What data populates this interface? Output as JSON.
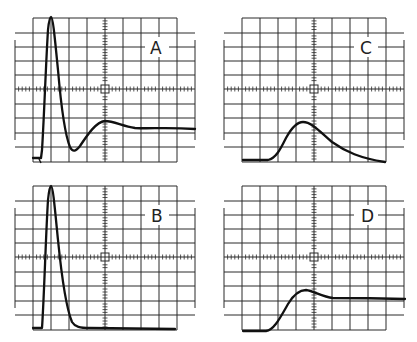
{
  "figure": {
    "panels": [
      {
        "id": "A",
        "label": "A",
        "position": "top-left",
        "trace": "damped-oscillation: sharp spike, undershoot, ringing, settles above baseline"
      },
      {
        "id": "C",
        "label": "C",
        "position": "top-right",
        "trace": "broad smooth pulse, slow rise and long decay"
      },
      {
        "id": "B",
        "label": "B",
        "position": "bottom-left",
        "trace": "narrow sharp pulse returning to baseline"
      },
      {
        "id": "D",
        "label": "D",
        "position": "bottom-right",
        "trace": "step rise with slight overshoot, settles to plateau"
      }
    ],
    "grid": {
      "horizontal_divisions": 10,
      "vertical_divisions": 10,
      "minor_ticks_per_division": 5
    },
    "colors": {
      "background": "#ffffff",
      "grid": "#2a2a2a",
      "trace": "#111111"
    }
  }
}
